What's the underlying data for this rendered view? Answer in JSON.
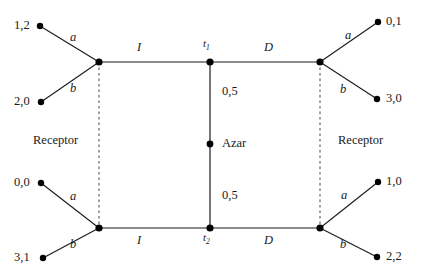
{
  "diagram": {
    "players": {
      "left_label": "Receptor",
      "right_label": "Receptor",
      "chance_label": "Azar"
    },
    "decision_nodes": [
      {
        "id": "t1",
        "label": "t",
        "sub": "1"
      },
      {
        "id": "t2",
        "label": "t",
        "sub": "2"
      }
    ],
    "chance_probabilities": {
      "upper": "0,5",
      "lower": "0,5"
    },
    "actions": {
      "top_left_edge": "I",
      "top_right_edge": "D",
      "bottom_left_edge": "I",
      "bottom_right_edge": "D",
      "top_left_a": "a",
      "top_left_b": "b",
      "top_right_a": "a",
      "top_right_b": "b",
      "bottom_left_a": "a",
      "bottom_left_b": "b",
      "bottom_right_a": "a",
      "bottom_right_b": "b"
    },
    "payoffs": {
      "top_left_upper": "1,2",
      "top_left_lower": "2,0",
      "top_right_upper": "0,1",
      "top_right_lower": "3,0",
      "bottom_left_upper": "0,0",
      "bottom_left_lower": "3,1",
      "bottom_right_upper": "1,0",
      "bottom_right_lower": "2,2"
    },
    "colors": {
      "line": "#1a1a1a",
      "node": "#000000",
      "background": "#ffffff",
      "dashed": "#555555"
    }
  }
}
